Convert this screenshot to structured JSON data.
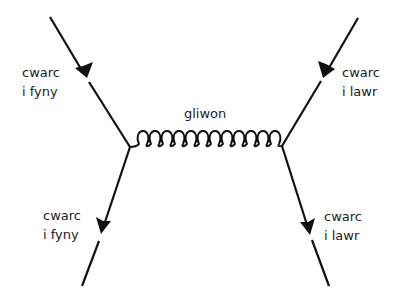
{
  "diagram": {
    "colors": {
      "line": "#111111",
      "text": "#222222",
      "background": "#ffffff"
    },
    "gluon": {
      "label": "gliwon",
      "loops": 13,
      "from": [
        130,
        147
      ],
      "to": [
        282,
        146
      ]
    },
    "particles": {
      "top_left": {
        "line1": "cwarc",
        "line2": "i fyny",
        "start": [
          50,
          17
        ],
        "end": [
          130,
          147
        ],
        "arrow": "incoming"
      },
      "top_right": {
        "line1": "cwarc",
        "line2": "i lawr",
        "start": [
          358,
          18
        ],
        "end": [
          282,
          146
        ],
        "arrow": "incoming"
      },
      "bottom_left": {
        "line1": "cwarc",
        "line2": "i fyny",
        "start": [
          130,
          147
        ],
        "end": [
          82,
          286
        ],
        "arrow": "outgoing"
      },
      "bottom_right": {
        "line1": "cwarc",
        "line2": "i lawr",
        "start": [
          282,
          146
        ],
        "end": [
          329,
          286
        ],
        "arrow": "outgoing"
      }
    }
  }
}
